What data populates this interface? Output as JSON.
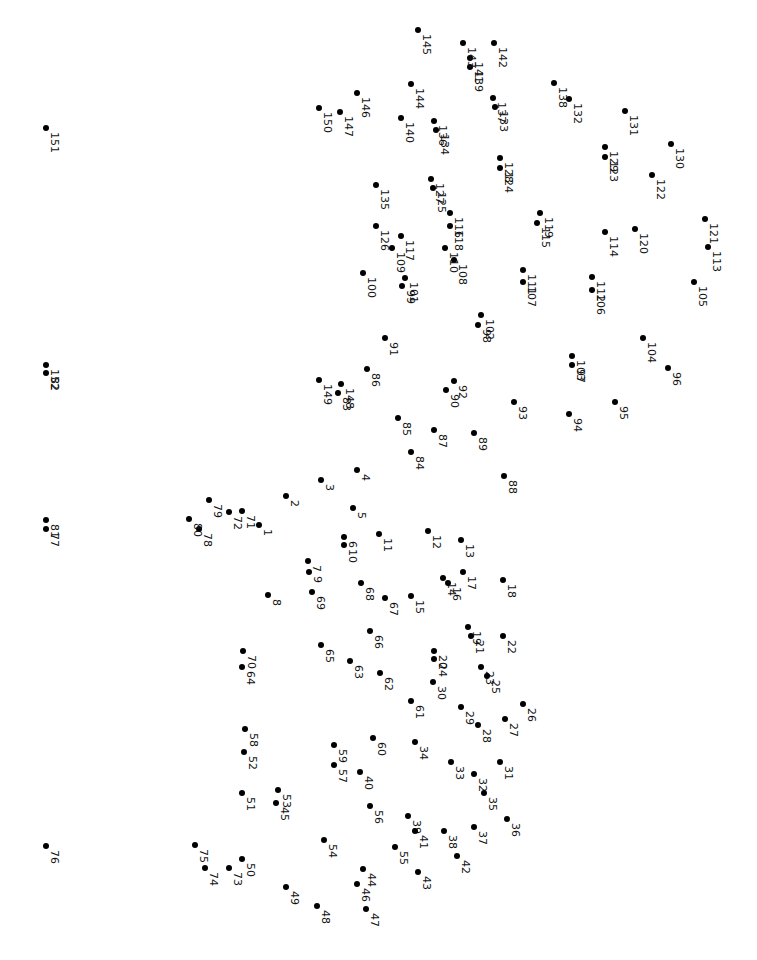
{
  "puzzle": {
    "type": "connect-the-dots",
    "orientation": "rotated 90deg clockwise",
    "dot_color": "#000000",
    "background": "#ffffff",
    "dots": [
      {
        "n": 1,
        "x": 259,
        "y": 525
      },
      {
        "n": 2,
        "x": 286,
        "y": 496
      },
      {
        "n": 3,
        "x": 321,
        "y": 480
      },
      {
        "n": 4,
        "x": 357,
        "y": 470
      },
      {
        "n": 5,
        "x": 353,
        "y": 508
      },
      {
        "n": 6,
        "x": 344,
        "y": 537
      },
      {
        "n": 7,
        "x": 308,
        "y": 561
      },
      {
        "n": 8,
        "x": 268,
        "y": 595
      },
      {
        "n": 9,
        "x": 309,
        "y": 572
      },
      {
        "n": 10,
        "x": 344,
        "y": 545
      },
      {
        "n": 11,
        "x": 379,
        "y": 534
      },
      {
        "n": 12,
        "x": 428,
        "y": 531
      },
      {
        "n": 13,
        "x": 461,
        "y": 540
      },
      {
        "n": 14,
        "x": 443,
        "y": 578
      },
      {
        "n": 15,
        "x": 411,
        "y": 596
      },
      {
        "n": 16,
        "x": 448,
        "y": 583
      },
      {
        "n": 17,
        "x": 463,
        "y": 572
      },
      {
        "n": 18,
        "x": 503,
        "y": 580
      },
      {
        "n": 19,
        "x": 468,
        "y": 627
      },
      {
        "n": 20,
        "x": 434,
        "y": 651
      },
      {
        "n": 21,
        "x": 471,
        "y": 636
      },
      {
        "n": 22,
        "x": 503,
        "y": 636
      },
      {
        "n": 23,
        "x": 481,
        "y": 667
      },
      {
        "n": 24,
        "x": 434,
        "y": 659
      },
      {
        "n": 25,
        "x": 487,
        "y": 676
      },
      {
        "n": 26,
        "x": 523,
        "y": 704
      },
      {
        "n": 27,
        "x": 505,
        "y": 719
      },
      {
        "n": 28,
        "x": 478,
        "y": 725
      },
      {
        "n": 29,
        "x": 461,
        "y": 707
      },
      {
        "n": 30,
        "x": 433,
        "y": 682
      },
      {
        "n": 31,
        "x": 500,
        "y": 762
      },
      {
        "n": 32,
        "x": 474,
        "y": 774
      },
      {
        "n": 33,
        "x": 451,
        "y": 762
      },
      {
        "n": 34,
        "x": 415,
        "y": 742
      },
      {
        "n": 35,
        "x": 484,
        "y": 793
      },
      {
        "n": 36,
        "x": 507,
        "y": 819
      },
      {
        "n": 37,
        "x": 474,
        "y": 827
      },
      {
        "n": 38,
        "x": 444,
        "y": 831
      },
      {
        "n": 39,
        "x": 408,
        "y": 816
      },
      {
        "n": 40,
        "x": 360,
        "y": 772
      },
      {
        "n": 41,
        "x": 415,
        "y": 831
      },
      {
        "n": 42,
        "x": 457,
        "y": 856
      },
      {
        "n": 43,
        "x": 418,
        "y": 872
      },
      {
        "n": 44,
        "x": 363,
        "y": 869
      },
      {
        "n": 45,
        "x": 276,
        "y": 803
      },
      {
        "n": 46,
        "x": 357,
        "y": 884
      },
      {
        "n": 47,
        "x": 366,
        "y": 909
      },
      {
        "n": 48,
        "x": 317,
        "y": 906
      },
      {
        "n": 49,
        "x": 286,
        "y": 887
      },
      {
        "n": 50,
        "x": 242,
        "y": 859
      },
      {
        "n": 51,
        "x": 242,
        "y": 793
      },
      {
        "n": 52,
        "x": 244,
        "y": 752
      },
      {
        "n": 53,
        "x": 278,
        "y": 790
      },
      {
        "n": 54,
        "x": 324,
        "y": 840
      },
      {
        "n": 55,
        "x": 395,
        "y": 847
      },
      {
        "n": 56,
        "x": 370,
        "y": 806
      },
      {
        "n": 57,
        "x": 334,
        "y": 765
      },
      {
        "n": 58,
        "x": 245,
        "y": 729
      },
      {
        "n": 59,
        "x": 334,
        "y": 745
      },
      {
        "n": 60,
        "x": 373,
        "y": 738
      },
      {
        "n": 61,
        "x": 411,
        "y": 701
      },
      {
        "n": 62,
        "x": 380,
        "y": 673
      },
      {
        "n": 63,
        "x": 350,
        "y": 661
      },
      {
        "n": 64,
        "x": 242,
        "y": 667
      },
      {
        "n": 65,
        "x": 321,
        "y": 645
      },
      {
        "n": 66,
        "x": 370,
        "y": 631
      },
      {
        "n": 67,
        "x": 385,
        "y": 598
      },
      {
        "n": 68,
        "x": 361,
        "y": 583
      },
      {
        "n": 69,
        "x": 312,
        "y": 592
      },
      {
        "n": 70,
        "x": 243,
        "y": 651
      },
      {
        "n": 71,
        "x": 242,
        "y": 511
      },
      {
        "n": 72,
        "x": 229,
        "y": 512
      },
      {
        "n": 73,
        "x": 229,
        "y": 868
      },
      {
        "n": 74,
        "x": 205,
        "y": 868
      },
      {
        "n": 75,
        "x": 195,
        "y": 845
      },
      {
        "n": 76,
        "x": 46,
        "y": 846
      },
      {
        "n": 77,
        "x": 46,
        "y": 529
      },
      {
        "n": 78,
        "x": 199,
        "y": 529
      },
      {
        "n": 79,
        "x": 209,
        "y": 500
      },
      {
        "n": 80,
        "x": 189,
        "y": 519
      },
      {
        "n": 81,
        "x": 46,
        "y": 520
      },
      {
        "n": 82,
        "x": 46,
        "y": 373
      },
      {
        "n": 83,
        "x": 338,
        "y": 393
      },
      {
        "n": 84,
        "x": 411,
        "y": 452
      },
      {
        "n": 85,
        "x": 398,
        "y": 418
      },
      {
        "n": 86,
        "x": 367,
        "y": 369
      },
      {
        "n": 87,
        "x": 434,
        "y": 430
      },
      {
        "n": 88,
        "x": 504,
        "y": 476
      },
      {
        "n": 89,
        "x": 474,
        "y": 433
      },
      {
        "n": 90,
        "x": 446,
        "y": 390
      },
      {
        "n": 91,
        "x": 385,
        "y": 338
      },
      {
        "n": 92,
        "x": 454,
        "y": 381
      },
      {
        "n": 93,
        "x": 514,
        "y": 402
      },
      {
        "n": 94,
        "x": 569,
        "y": 414
      },
      {
        "n": 95,
        "x": 615,
        "y": 402
      },
      {
        "n": 96,
        "x": 668,
        "y": 368
      },
      {
        "n": 97,
        "x": 572,
        "y": 365
      },
      {
        "n": 98,
        "x": 478,
        "y": 325
      },
      {
        "n": 99,
        "x": 402,
        "y": 286
      },
      {
        "n": 100,
        "x": 363,
        "y": 273
      },
      {
        "n": 101,
        "x": 405,
        "y": 278
      },
      {
        "n": 102,
        "x": 481,
        "y": 315
      },
      {
        "n": 103,
        "x": 572,
        "y": 356
      },
      {
        "n": 104,
        "x": 643,
        "y": 338
      },
      {
        "n": 105,
        "x": 694,
        "y": 282
      },
      {
        "n": 106,
        "x": 592,
        "y": 290
      },
      {
        "n": 107,
        "x": 523,
        "y": 282
      },
      {
        "n": 108,
        "x": 454,
        "y": 260
      },
      {
        "n": 109,
        "x": 392,
        "y": 248
      },
      {
        "n": 110,
        "x": 445,
        "y": 248
      },
      {
        "n": 111,
        "x": 523,
        "y": 270
      },
      {
        "n": 112,
        "x": 592,
        "y": 277
      },
      {
        "n": 113,
        "x": 708,
        "y": 247
      },
      {
        "n": 114,
        "x": 605,
        "y": 232
      },
      {
        "n": 115,
        "x": 537,
        "y": 223
      },
      {
        "n": 116,
        "x": 450,
        "y": 213
      },
      {
        "n": 117,
        "x": 401,
        "y": 236
      },
      {
        "n": 118,
        "x": 450,
        "y": 226
      },
      {
        "n": 119,
        "x": 540,
        "y": 213
      },
      {
        "n": 120,
        "x": 635,
        "y": 229
      },
      {
        "n": 121,
        "x": 705,
        "y": 219
      },
      {
        "n": 122,
        "x": 652,
        "y": 175
      },
      {
        "n": 123,
        "x": 605,
        "y": 157
      },
      {
        "n": 124,
        "x": 500,
        "y": 168
      },
      {
        "n": 125,
        "x": 433,
        "y": 188
      },
      {
        "n": 126,
        "x": 376,
        "y": 226
      },
      {
        "n": 127,
        "x": 431,
        "y": 179
      },
      {
        "n": 128,
        "x": 500,
        "y": 158
      },
      {
        "n": 129,
        "x": 605,
        "y": 147
      },
      {
        "n": 130,
        "x": 671,
        "y": 144
      },
      {
        "n": 131,
        "x": 625,
        "y": 111
      },
      {
        "n": 132,
        "x": 569,
        "y": 99
      },
      {
        "n": 133,
        "x": 495,
        "y": 107
      },
      {
        "n": 134,
        "x": 436,
        "y": 130
      },
      {
        "n": 135,
        "x": 376,
        "y": 185
      },
      {
        "n": 136,
        "x": 434,
        "y": 121
      },
      {
        "n": 137,
        "x": 493,
        "y": 98
      },
      {
        "n": 138,
        "x": 554,
        "y": 83
      },
      {
        "n": 139,
        "x": 470,
        "y": 67
      },
      {
        "n": 140,
        "x": 401,
        "y": 118
      },
      {
        "n": 141,
        "x": 470,
        "y": 58
      },
      {
        "n": 142,
        "x": 494,
        "y": 43
      },
      {
        "n": 143,
        "x": 463,
        "y": 43
      },
      {
        "n": 144,
        "x": 411,
        "y": 84
      },
      {
        "n": 145,
        "x": 418,
        "y": 30
      },
      {
        "n": 146,
        "x": 357,
        "y": 93
      },
      {
        "n": 147,
        "x": 340,
        "y": 112
      },
      {
        "n": 148,
        "x": 341,
        "y": 384
      },
      {
        "n": 149,
        "x": 319,
        "y": 380
      },
      {
        "n": 150,
        "x": 319,
        "y": 108
      },
      {
        "n": 151,
        "x": 46,
        "y": 128
      },
      {
        "n": 152,
        "x": 46,
        "y": 365
      }
    ]
  }
}
